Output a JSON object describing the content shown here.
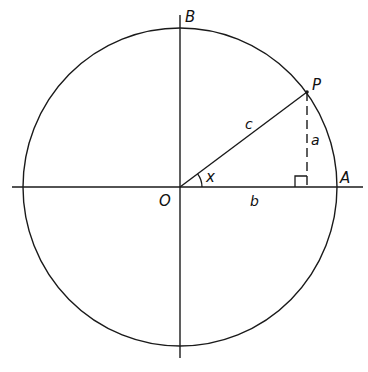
{
  "diagram": {
    "points": {
      "origin": "O",
      "top": "B",
      "right": "A",
      "on_circle": "P"
    },
    "sides": {
      "hypotenuse": "c",
      "opposite": "a",
      "adjacent": "b"
    },
    "angle": "x",
    "angle_degrees": 37,
    "right_angle_marker": true,
    "colors": {
      "stroke": "#1a1a1a",
      "background": "#ffffff"
    }
  }
}
